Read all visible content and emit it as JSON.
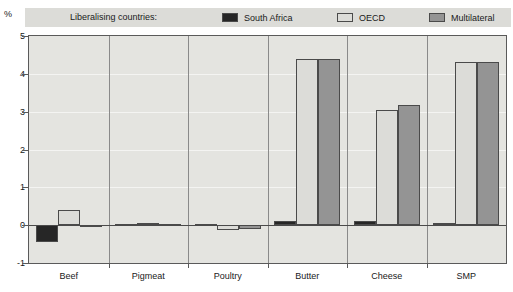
{
  "legend": {
    "title": "Liberalising countries:",
    "entries": [
      {
        "label": "South Africa",
        "color": "#262626"
      },
      {
        "label": "OECD",
        "color": "#dcdcd8"
      },
      {
        "label": "Multilateral",
        "color": "#949494"
      }
    ]
  },
  "axis": {
    "y_unit": "%",
    "y_ticks": [
      "5",
      "4",
      "3",
      "2",
      "1",
      "0",
      "-1"
    ]
  },
  "chart_data": {
    "type": "bar",
    "title": "",
    "subtitle": "",
    "xlabel": "",
    "ylabel": "%",
    "ylim": [
      -1,
      5
    ],
    "yticks": [
      -1,
      0,
      1,
      2,
      3,
      4,
      5
    ],
    "grid": true,
    "legend_position": "top",
    "legend_title": "Liberalising countries:",
    "categories": [
      "Beef",
      "Pigmeat",
      "Poultry",
      "Butter",
      "Cheese",
      "SMP"
    ],
    "series": [
      {
        "name": "South Africa",
        "color": "#262626",
        "values": [
          -0.45,
          0.02,
          0.02,
          0.1,
          0.12,
          0.07
        ]
      },
      {
        "name": "OECD",
        "color": "#dcdcd8",
        "values": [
          0.4,
          0.05,
          -0.12,
          4.38,
          3.05,
          4.3
        ]
      },
      {
        "name": "Multilateral",
        "color": "#949494",
        "values": [
          -0.02,
          0.03,
          -0.1,
          4.38,
          3.17,
          4.3
        ]
      }
    ]
  }
}
